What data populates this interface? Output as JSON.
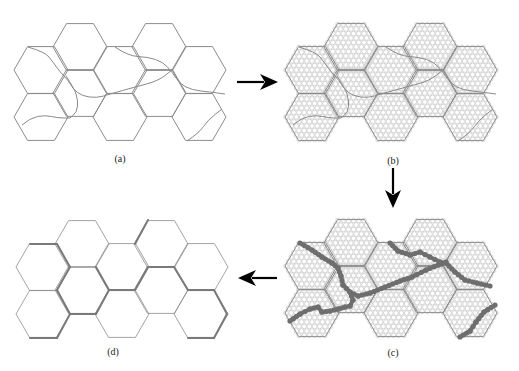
{
  "figure": {
    "clipped_caption_band": "······································",
    "hex": {
      "radius": 27,
      "half_height": 23.4
    },
    "hex_centers": [
      [
        80,
        47
      ],
      [
        159,
        47
      ],
      [
        41,
        70
      ],
      [
        120,
        70
      ],
      [
        199,
        70
      ],
      [
        80,
        93
      ],
      [
        159,
        93
      ],
      [
        41,
        117
      ],
      [
        120,
        117
      ],
      [
        199,
        117
      ]
    ],
    "colors": {
      "hex_edge": "#8c8c8c",
      "curve": "#8a8a8a",
      "circle": "#bdbdbd",
      "path": "#6e6e6e",
      "boundary": "#7a7a7a",
      "arrow": "#000000",
      "label": "#222222"
    },
    "panels": [
      {
        "id": "a",
        "label": "(a)",
        "offset": [
          0,
          0
        ],
        "label_pos": [
          120,
          153
        ],
        "show_circles": false,
        "curves": [
          [
            [
              28,
              47
            ],
            [
              45,
              52
            ],
            [
              53,
              62
            ],
            [
              60,
              72
            ],
            [
              68,
              80
            ],
            [
              73,
              89
            ],
            [
              82,
              96
            ],
            [
              97,
              98
            ],
            [
              110,
              94
            ],
            [
              135,
              87
            ],
            [
              158,
              81
            ],
            [
              172,
              70
            ]
          ],
          [
            [
              115,
              47
            ],
            [
              128,
              56
            ],
            [
              148,
              57
            ],
            [
              163,
              62
            ],
            [
              172,
              72
            ],
            [
              180,
              84
            ],
            [
              192,
              90
            ],
            [
              210,
              92
            ],
            [
              225,
              94
            ]
          ],
          [
            [
              66,
              76
            ],
            [
              74,
              88
            ],
            [
              78,
              100
            ],
            [
              77,
              112
            ],
            [
              70,
              118
            ]
          ],
          [
            [
              22,
              125
            ],
            [
              30,
              118
            ],
            [
              45,
              115
            ],
            [
              58,
              118
            ],
            [
              70,
              118
            ]
          ],
          [
            [
              187,
              141
            ],
            [
              199,
              133
            ],
            [
              208,
              120
            ],
            [
              222,
              109
            ]
          ]
        ]
      },
      {
        "id": "b",
        "label": "(b)",
        "offset": [
          271,
          0
        ],
        "label_pos": [
          393,
          155
        ],
        "show_circles": true,
        "curves": [
          [
            [
              28,
              47
            ],
            [
              45,
              52
            ],
            [
              53,
              62
            ],
            [
              60,
              72
            ],
            [
              68,
              80
            ],
            [
              73,
              89
            ],
            [
              82,
              96
            ],
            [
              97,
              98
            ],
            [
              110,
              94
            ],
            [
              135,
              87
            ],
            [
              158,
              81
            ],
            [
              172,
              70
            ]
          ],
          [
            [
              115,
              47
            ],
            [
              128,
              56
            ],
            [
              148,
              57
            ],
            [
              163,
              62
            ],
            [
              172,
              72
            ],
            [
              180,
              84
            ],
            [
              192,
              90
            ],
            [
              210,
              92
            ],
            [
              225,
              94
            ]
          ],
          [
            [
              66,
              76
            ],
            [
              74,
              88
            ],
            [
              78,
              100
            ],
            [
              77,
              112
            ],
            [
              70,
              118
            ]
          ],
          [
            [
              22,
              125
            ],
            [
              30,
              118
            ],
            [
              45,
              115
            ],
            [
              58,
              118
            ],
            [
              70,
              118
            ]
          ],
          [
            [
              187,
              141
            ],
            [
              199,
              133
            ],
            [
              208,
              120
            ],
            [
              222,
              109
            ]
          ]
        ]
      },
      {
        "id": "c",
        "label": "(c)",
        "offset": [
          271,
          196
        ],
        "label_pos": [
          393,
          347
        ],
        "show_circles": true,
        "dot_paths": [
          [
            [
              300,
              243
            ],
            [
              312,
              250
            ],
            [
              322,
              257
            ],
            [
              332,
              263
            ],
            [
              338,
              268
            ],
            [
              341,
              276
            ],
            [
              343,
              285
            ],
            [
              350,
              292
            ],
            [
              358,
              296
            ],
            [
              370,
              293
            ],
            [
              385,
              287
            ],
            [
              400,
              281
            ],
            [
              412,
              277
            ],
            [
              426,
              270
            ],
            [
              438,
              265
            ],
            [
              446,
              262
            ]
          ],
          [
            [
              350,
              292
            ],
            [
              353,
              300
            ],
            [
              350,
              306
            ],
            [
              345,
              307
            ],
            [
              338,
              309
            ],
            [
              330,
              311
            ],
            [
              322,
              312
            ],
            [
              318,
              307
            ],
            [
              310,
              309
            ],
            [
              300,
              314
            ],
            [
              290,
              321
            ]
          ],
          [
            [
              390,
              243
            ],
            [
              398,
              251
            ],
            [
              410,
              255
            ],
            [
              420,
              252
            ],
            [
              430,
              257
            ],
            [
              440,
              262
            ],
            [
              446,
              263
            ],
            [
              455,
              272
            ],
            [
              465,
              280
            ],
            [
              477,
              283
            ],
            [
              490,
              286
            ]
          ],
          [
            [
              495,
              305
            ],
            [
              484,
              312
            ],
            [
              476,
              322
            ],
            [
              470,
              331
            ],
            [
              460,
              337
            ]
          ]
        ]
      },
      {
        "id": "d",
        "label": "(d)",
        "offset": [
          2,
          197
        ],
        "label_pos": [
          113,
          346
        ],
        "show_circles": false,
        "thick_edges": [
          [
            [
              28,
              47
            ],
            [
              55,
              47
            ]
          ],
          [
            [
              55,
              47
            ],
            [
              68,
              70
            ]
          ],
          [
            [
              68,
              70
            ],
            [
              55,
              93
            ]
          ],
          [
            [
              55,
              93
            ],
            [
              68,
              117
            ]
          ],
          [
            [
              68,
              117
            ],
            [
              94,
              117
            ]
          ],
          [
            [
              94,
              117
            ],
            [
              107,
              93
            ]
          ],
          [
            [
              107,
              93
            ],
            [
              94,
              70
            ]
          ],
          [
            [
              28,
              141
            ],
            [
              55,
              141
            ]
          ],
          [
            [
              55,
              141
            ],
            [
              68,
              117
            ]
          ],
          [
            [
              133,
              93
            ],
            [
              146,
              70
            ]
          ],
          [
            [
              146,
              70
            ],
            [
              172,
              70
            ]
          ],
          [
            [
              172,
              70
            ],
            [
              186,
              93
            ]
          ],
          [
            [
              186,
              93
            ],
            [
              212,
              93
            ]
          ],
          [
            [
              212,
              93
            ],
            [
              225,
              117
            ]
          ],
          [
            [
              225,
              117
            ],
            [
              212,
              141
            ]
          ],
          [
            [
              212,
              141
            ],
            [
              186,
              141
            ]
          ],
          [
            [
              107,
              93
            ],
            [
              133,
              93
            ]
          ],
          [
            [
              146,
              23
            ],
            [
              133,
              47
            ]
          ]
        ]
      }
    ],
    "arrows": [
      {
        "name": "arrow-right",
        "from": [
          237,
          82
        ],
        "to": [
          278,
          82
        ]
      },
      {
        "name": "arrow-down",
        "from": [
          393,
          168
        ],
        "to": [
          393,
          208
        ]
      },
      {
        "name": "arrow-left",
        "from": [
          277,
          278
        ],
        "to": [
          238,
          278
        ]
      }
    ]
  }
}
